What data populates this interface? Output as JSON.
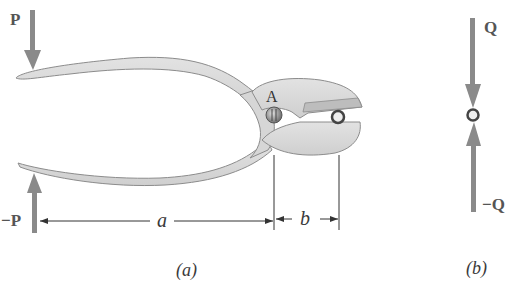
{
  "figure_a": {
    "caption": "(a)",
    "force_top_label": "P",
    "force_bottom_label": "−P",
    "pivot_label": "A",
    "dim_a_label": "a",
    "dim_b_label": "b"
  },
  "figure_b": {
    "caption": "(b)",
    "force_top_label": "Q",
    "force_bottom_label": "−Q"
  },
  "colors": {
    "arrow": "#8a8a8a",
    "plier_fill": "#d8d8d8",
    "plier_stroke": "#8c8c8c",
    "dimension_line": "#333333"
  }
}
